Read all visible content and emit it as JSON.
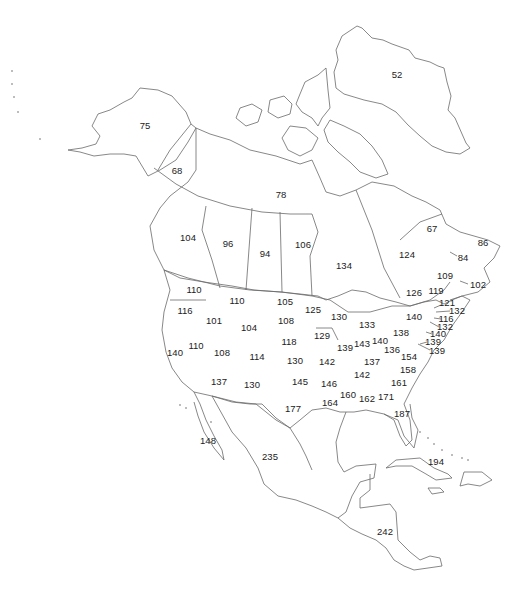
{
  "map": {
    "region": "North America",
    "style": "outline map with numeric labels per state/province/country",
    "labels": [
      {
        "id": "greenland",
        "value": "52",
        "x": 397,
        "y": 75
      },
      {
        "id": "alaska",
        "value": "75",
        "x": 145,
        "y": 126
      },
      {
        "id": "yukon",
        "value": "68",
        "x": 177,
        "y": 171
      },
      {
        "id": "nwt-nunavut",
        "value": "78",
        "x": 281,
        "y": 195
      },
      {
        "id": "quebec-north",
        "value": "67",
        "x": 432,
        "y": 229
      },
      {
        "id": "newfoundland",
        "value": "86",
        "x": 483,
        "y": 243
      },
      {
        "id": "british-columbia",
        "value": "104",
        "x": 188,
        "y": 238
      },
      {
        "id": "alberta",
        "value": "96",
        "x": 228,
        "y": 244
      },
      {
        "id": "saskatchewan",
        "value": "94",
        "x": 265,
        "y": 254
      },
      {
        "id": "manitoba",
        "value": "106",
        "x": 303,
        "y": 245
      },
      {
        "id": "ontario",
        "value": "134",
        "x": 344,
        "y": 266
      },
      {
        "id": "quebec",
        "value": "124",
        "x": 407,
        "y": 255
      },
      {
        "id": "prince-edward-island",
        "value": "84",
        "x": 463,
        "y": 258
      },
      {
        "id": "new-brunswick",
        "value": "109",
        "x": 445,
        "y": 276
      },
      {
        "id": "nova-scotia",
        "value": "102",
        "x": 478,
        "y": 285
      },
      {
        "id": "ottawa-montreal",
        "value": "126",
        "x": 414,
        "y": 293
      },
      {
        "id": "maine",
        "value": "119",
        "x": 436,
        "y": 291
      },
      {
        "id": "washington",
        "value": "110",
        "x": 194,
        "y": 290
      },
      {
        "id": "montana",
        "value": "110",
        "x": 237,
        "y": 301
      },
      {
        "id": "north-dakota",
        "value": "105",
        "x": 285,
        "y": 302
      },
      {
        "id": "minnesota",
        "value": "125",
        "x": 313,
        "y": 310
      },
      {
        "id": "new-hampshire",
        "value": "121",
        "x": 447,
        "y": 303
      },
      {
        "id": "massachusetts",
        "value": "132",
        "x": 457,
        "y": 311
      },
      {
        "id": "oregon",
        "value": "116",
        "x": 185,
        "y": 311
      },
      {
        "id": "idaho",
        "value": "101",
        "x": 214,
        "y": 321
      },
      {
        "id": "south-dakota",
        "value": "108",
        "x": 286,
        "y": 321
      },
      {
        "id": "wisconsin",
        "value": "130",
        "x": 339,
        "y": 317
      },
      {
        "id": "michigan",
        "value": "133",
        "x": 367,
        "y": 325
      },
      {
        "id": "new-york",
        "value": "140",
        "x": 414,
        "y": 317
      },
      {
        "id": "connecticut",
        "value": "116",
        "x": 446,
        "y": 319
      },
      {
        "id": "rhode-island",
        "value": "132",
        "x": 445,
        "y": 327
      },
      {
        "id": "wyoming",
        "value": "104",
        "x": 249,
        "y": 328
      },
      {
        "id": "iowa",
        "value": "129",
        "x": 322,
        "y": 336
      },
      {
        "id": "pennsylvania",
        "value": "138",
        "x": 401,
        "y": 333
      },
      {
        "id": "new-jersey",
        "value": "140",
        "x": 438,
        "y": 334
      },
      {
        "id": "nevada",
        "value": "110",
        "x": 196,
        "y": 346
      },
      {
        "id": "nebraska",
        "value": "118",
        "x": 289,
        "y": 342
      },
      {
        "id": "illinois",
        "value": "139",
        "x": 345,
        "y": 348
      },
      {
        "id": "indiana",
        "value": "143",
        "x": 362,
        "y": 344
      },
      {
        "id": "ohio",
        "value": "140",
        "x": 380,
        "y": 341
      },
      {
        "id": "delaware",
        "value": "139",
        "x": 433,
        "y": 342
      },
      {
        "id": "maryland",
        "value": "139",
        "x": 437,
        "y": 351
      },
      {
        "id": "california",
        "value": "140",
        "x": 175,
        "y": 353
      },
      {
        "id": "utah",
        "value": "108",
        "x": 222,
        "y": 353
      },
      {
        "id": "colorado",
        "value": "114",
        "x": 257,
        "y": 357
      },
      {
        "id": "west-virginia",
        "value": "136",
        "x": 392,
        "y": 350
      },
      {
        "id": "virginia",
        "value": "154",
        "x": 409,
        "y": 357
      },
      {
        "id": "kansas",
        "value": "130",
        "x": 295,
        "y": 361
      },
      {
        "id": "missouri",
        "value": "142",
        "x": 327,
        "y": 362
      },
      {
        "id": "kentucky",
        "value": "137",
        "x": 372,
        "y": 362
      },
      {
        "id": "north-carolina",
        "value": "158",
        "x": 408,
        "y": 370
      },
      {
        "id": "tennessee",
        "value": "142",
        "x": 362,
        "y": 375
      },
      {
        "id": "arizona",
        "value": "137",
        "x": 219,
        "y": 382
      },
      {
        "id": "new-mexico",
        "value": "130",
        "x": 252,
        "y": 385
      },
      {
        "id": "oklahoma",
        "value": "145",
        "x": 300,
        "y": 382
      },
      {
        "id": "arkansas",
        "value": "146",
        "x": 329,
        "y": 384
      },
      {
        "id": "south-carolina",
        "value": "161",
        "x": 399,
        "y": 383
      },
      {
        "id": "mississippi",
        "value": "160",
        "x": 348,
        "y": 395
      },
      {
        "id": "alabama",
        "value": "162",
        "x": 367,
        "y": 399
      },
      {
        "id": "georgia",
        "value": "171",
        "x": 386,
        "y": 397
      },
      {
        "id": "louisiana",
        "value": "164",
        "x": 330,
        "y": 403
      },
      {
        "id": "texas",
        "value": "177",
        "x": 293,
        "y": 409
      },
      {
        "id": "florida",
        "value": "187",
        "x": 402,
        "y": 414
      },
      {
        "id": "baja-california",
        "value": "148",
        "x": 208,
        "y": 441
      },
      {
        "id": "mexico",
        "value": "235",
        "x": 270,
        "y": 457
      },
      {
        "id": "cuba-caribbean",
        "value": "194",
        "x": 436,
        "y": 462
      },
      {
        "id": "central-america",
        "value": "242",
        "x": 385,
        "y": 532
      }
    ]
  },
  "chart_data": {
    "type": "table",
    "title": "",
    "regions": [
      "Greenland",
      "Alaska",
      "Yukon",
      "NWT/Nunavut",
      "Northern Quebec",
      "Newfoundland",
      "British Columbia",
      "Alberta",
      "Saskatchewan",
      "Manitoba",
      "Ontario",
      "Quebec",
      "Prince Edward Island",
      "New Brunswick",
      "Nova Scotia",
      "Southern Quebec/Ontario",
      "Maine",
      "Washington",
      "Montana",
      "North Dakota",
      "Minnesota",
      "New Hampshire",
      "Massachusetts",
      "Oregon",
      "Idaho",
      "South Dakota",
      "Wisconsin",
      "Michigan",
      "New York",
      "Connecticut",
      "Rhode Island",
      "Wyoming",
      "Iowa",
      "Pennsylvania",
      "New Jersey",
      "Nevada",
      "Nebraska",
      "Illinois",
      "Indiana",
      "Ohio",
      "Delaware",
      "Maryland",
      "California",
      "Utah",
      "Colorado",
      "West Virginia",
      "Virginia",
      "Kansas",
      "Missouri",
      "Kentucky",
      "North Carolina",
      "Tennessee",
      "Arizona",
      "New Mexico",
      "Oklahoma",
      "Arkansas",
      "South Carolina",
      "Mississippi",
      "Alabama",
      "Georgia",
      "Louisiana",
      "Texas",
      "Florida",
      "Baja California",
      "Mexico",
      "Cuba/Caribbean",
      "Central America"
    ],
    "values": [
      52,
      75,
      68,
      78,
      67,
      86,
      104,
      96,
      94,
      106,
      134,
      124,
      84,
      109,
      102,
      126,
      119,
      110,
      110,
      105,
      125,
      121,
      132,
      116,
      101,
      108,
      130,
      133,
      140,
      116,
      132,
      104,
      129,
      138,
      140,
      110,
      118,
      139,
      143,
      140,
      139,
      139,
      140,
      108,
      114,
      136,
      154,
      130,
      142,
      137,
      158,
      142,
      137,
      130,
      145,
      146,
      161,
      160,
      162,
      171,
      164,
      177,
      187,
      148,
      235,
      194,
      242
    ]
  }
}
